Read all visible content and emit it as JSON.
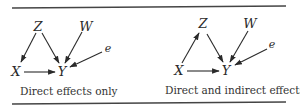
{
  "panels": [
    {
      "id": "left",
      "caption": "Direct effects only",
      "nodes": {
        "Z": {
          "label": "Z"
        },
        "W": {
          "label": "W"
        },
        "e": {
          "label": "e"
        },
        "X": {
          "label": "X"
        },
        "Y": {
          "label": "Y"
        }
      },
      "edges": [
        {
          "from": "Z",
          "to": "X"
        },
        {
          "from": "Z",
          "to": "Y"
        },
        {
          "from": "W",
          "to": "Y"
        },
        {
          "from": "e",
          "to": "Y"
        },
        {
          "from": "X",
          "to": "Y"
        }
      ]
    },
    {
      "id": "right",
      "caption": "Direct and indirect effects",
      "nodes": {
        "Z": {
          "label": "Z"
        },
        "W": {
          "label": "W"
        },
        "e": {
          "label": "e"
        },
        "X": {
          "label": "X"
        },
        "Y": {
          "label": "Y"
        }
      },
      "edges": [
        {
          "from": "X",
          "to": "Z"
        },
        {
          "from": "Z",
          "to": "Y"
        },
        {
          "from": "W",
          "to": "Y"
        },
        {
          "from": "e",
          "to": "Y"
        },
        {
          "from": "X",
          "to": "Y"
        }
      ]
    }
  ]
}
